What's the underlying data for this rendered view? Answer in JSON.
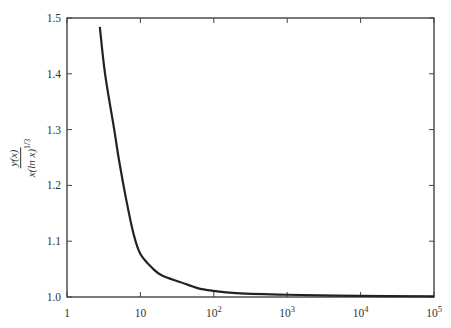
{
  "chart_data": {
    "type": "line",
    "title": "",
    "xlabel": "",
    "ylabel": {
      "numerator": "y(x)",
      "denominator_base": "x(ln x)",
      "denominator_exp": "1/3"
    },
    "xscale": "log",
    "xlim": [
      1,
      100000
    ],
    "ylim": [
      1.0,
      1.5
    ],
    "grid": false,
    "legend": null,
    "x_ticks": [
      {
        "value": 1,
        "label": "1",
        "sup": ""
      },
      {
        "value": 10,
        "label": "10",
        "sup": ""
      },
      {
        "value": 100,
        "label": "10",
        "sup": "2"
      },
      {
        "value": 1000,
        "label": "10",
        "sup": "3"
      },
      {
        "value": 10000,
        "label": "10",
        "sup": "4"
      },
      {
        "value": 100000,
        "label": "10",
        "sup": "5"
      }
    ],
    "y_ticks": [
      {
        "value": 1.0,
        "label": "1.0"
      },
      {
        "value": 1.1,
        "label": "1.1"
      },
      {
        "value": 1.2,
        "label": "1.2"
      },
      {
        "value": 1.3,
        "label": "1.3"
      },
      {
        "value": 1.4,
        "label": "1.4"
      },
      {
        "value": 1.5,
        "label": "1.5"
      }
    ],
    "series": [
      {
        "name": "y(x) / x(ln x)^(1/3)",
        "color": "#222222",
        "x": [
          2.8,
          3.3,
          4.4,
          5.1,
          6.4,
          8.0,
          10,
          15,
          20,
          34.6,
          60,
          100,
          200,
          1000,
          10000,
          100000
        ],
        "y": [
          1.484,
          1.4,
          1.3,
          1.246,
          1.175,
          1.115,
          1.077,
          1.05,
          1.038,
          1.027,
          1.016,
          1.011,
          1.007,
          1.004,
          1.002,
          1.001
        ]
      }
    ]
  }
}
